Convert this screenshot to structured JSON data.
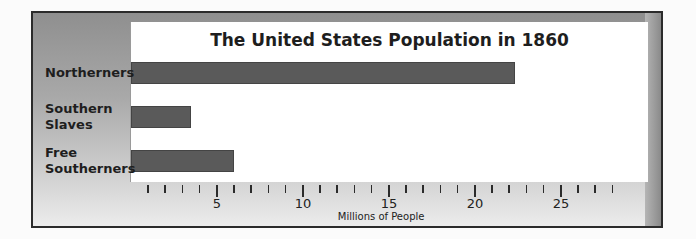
{
  "chart_data": {
    "type": "bar",
    "orientation": "horizontal",
    "title": "The United States Population in 1860",
    "categories": [
      "Northerners",
      "Southern Slaves",
      "Free Southerners"
    ],
    "category_lines": [
      [
        "Northerners"
      ],
      [
        "Southern",
        "Slaves"
      ],
      [
        "Free",
        "Southerners"
      ]
    ],
    "values": [
      22.3,
      3.5,
      6.0
    ],
    "xlabel": "Millions of People",
    "ylabel": "",
    "xlim": [
      0,
      29
    ],
    "major_ticks": [
      5,
      10,
      15,
      20,
      25
    ],
    "minor_tick_step": 1,
    "grid": false,
    "legend": null,
    "bar_color": "#5a5a5a"
  }
}
